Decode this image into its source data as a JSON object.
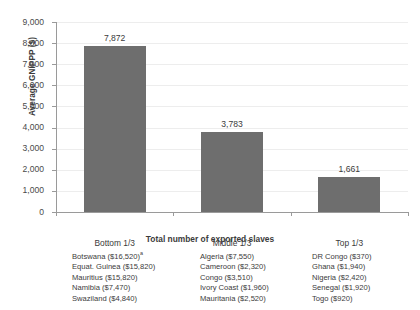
{
  "chart_data": {
    "type": "bar",
    "title": "",
    "categories": [
      "Bottom 1/3",
      "Middle 1/3",
      "Top 1/3"
    ],
    "values": [
      7872,
      3783,
      1661
    ],
    "value_labels": [
      "7,872",
      "3,783",
      "1,661"
    ],
    "xlabel": "Total number of exported slaves",
    "ylabel": "Average GNIPPP ($)",
    "ylim": [
      0,
      9000
    ],
    "ytick_labels": [
      "0",
      "1,000",
      "2,000",
      "3,000",
      "4,000",
      "5,000",
      "6,000",
      "7,000",
      "8,000",
      "9,000"
    ],
    "ytick_values": [
      0,
      1000,
      2000,
      3000,
      4000,
      5000,
      6000,
      7000,
      8000,
      9000
    ],
    "grid": "horizontal",
    "legend_position": "below-axis",
    "bar_color": "#6e6e6e",
    "grid_color": "#ededed",
    "axis_color": "#9a9a9a"
  },
  "legend_columns": [
    {
      "group": "Bottom 1/3",
      "entries": [
        {
          "text": "Botswana ($16,520)",
          "marker": "a"
        },
        {
          "text": "Equat. Guinea ($15,820)",
          "marker": ""
        },
        {
          "text": "Mauritius ($15,820)",
          "marker": ""
        },
        {
          "text": "Namibia ($7,470)",
          "marker": ""
        },
        {
          "text": "Swaziland ($4,840)",
          "marker": ""
        }
      ]
    },
    {
      "group": "Middle 1/3",
      "entries": [
        {
          "text": "Algeria ($7,550)",
          "marker": ""
        },
        {
          "text": "Cameroon ($2,320)",
          "marker": ""
        },
        {
          "text": "Congo ($3,510)",
          "marker": ""
        },
        {
          "text": "Ivory Coast ($1,960)",
          "marker": ""
        },
        {
          "text": "Mauritania ($2,520)",
          "marker": ""
        }
      ]
    },
    {
      "group": "Top 1/3",
      "entries": [
        {
          "text": "DR Congo ($370)",
          "marker": ""
        },
        {
          "text": "Ghana ($1,940)",
          "marker": ""
        },
        {
          "text": "Nigeria ($2,420)",
          "marker": ""
        },
        {
          "text": "Senegal ($1,920)",
          "marker": ""
        },
        {
          "text": "Togo ($920)",
          "marker": ""
        }
      ]
    }
  ]
}
